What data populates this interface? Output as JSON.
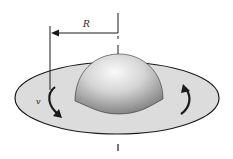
{
  "diagram": {
    "labels": {
      "radius": "R",
      "velocity": "v"
    },
    "colors": {
      "disk_fill": "#dcdcdc",
      "disk_stroke": "#1a1a1a",
      "dome_light": "#f4f4f4",
      "dome_dark": "#7d7d7d",
      "line": "#1a1a1a",
      "background": "#ffffff"
    },
    "elements": [
      "rotating-disk",
      "central-bulge-dome",
      "radius-dimension-arrow",
      "rotation-axis",
      "rotation-arrow-left",
      "rotation-arrow-right"
    ]
  }
}
